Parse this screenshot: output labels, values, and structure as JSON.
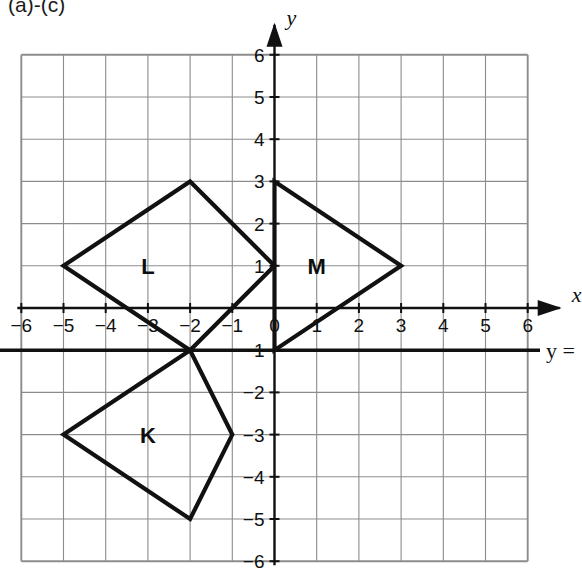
{
  "caption": "(a)-(c)",
  "axes": {
    "x_label": "x",
    "y_label": "y",
    "x_ticks": [
      "-6",
      "-5",
      "-4",
      "-3",
      "-2",
      "-1",
      "0",
      "1",
      "2",
      "3",
      "4",
      "5",
      "6"
    ],
    "y_ticks_positive": [
      "6",
      "5",
      "4",
      "3",
      "2",
      "1"
    ],
    "y_ticks_negative": [
      "-1",
      "-2",
      "-3",
      "-4",
      "-5",
      "-6"
    ],
    "x_min": -6,
    "x_max": 6,
    "y_min": -6,
    "y_max": 6,
    "grid": true
  },
  "line_of_reflection": {
    "label": "y =",
    "y_value": -1
  },
  "chart_data": {
    "type": "scatter",
    "title": "(a)-(c)",
    "xlabel": "x",
    "ylabel": "y",
    "xlim": [
      -6,
      6
    ],
    "ylim": [
      -6,
      6
    ],
    "grid": true,
    "shapes": [
      {
        "name": "L",
        "label": "L",
        "label_position": [
          -3,
          1
        ],
        "vertices": [
          [
            -5,
            1
          ],
          [
            -2,
            3
          ],
          [
            0,
            1
          ],
          [
            -2,
            -1
          ]
        ]
      },
      {
        "name": "M",
        "label": "M",
        "label_position": [
          1,
          1
        ],
        "vertices": [
          [
            0,
            3
          ],
          [
            3,
            1
          ],
          [
            0,
            -1
          ]
        ]
      },
      {
        "name": "K",
        "label": "K",
        "label_position": [
          -3,
          -3
        ],
        "vertices": [
          [
            -5,
            -3
          ],
          [
            -2,
            -1
          ],
          [
            -1,
            -3
          ],
          [
            -2,
            -5
          ]
        ]
      }
    ],
    "annotations": [
      {
        "text": "y =",
        "x": 6.6,
        "y": -1,
        "type": "line-label"
      }
    ]
  },
  "shape_labels": {
    "L": "L",
    "M": "M",
    "K": "K"
  }
}
